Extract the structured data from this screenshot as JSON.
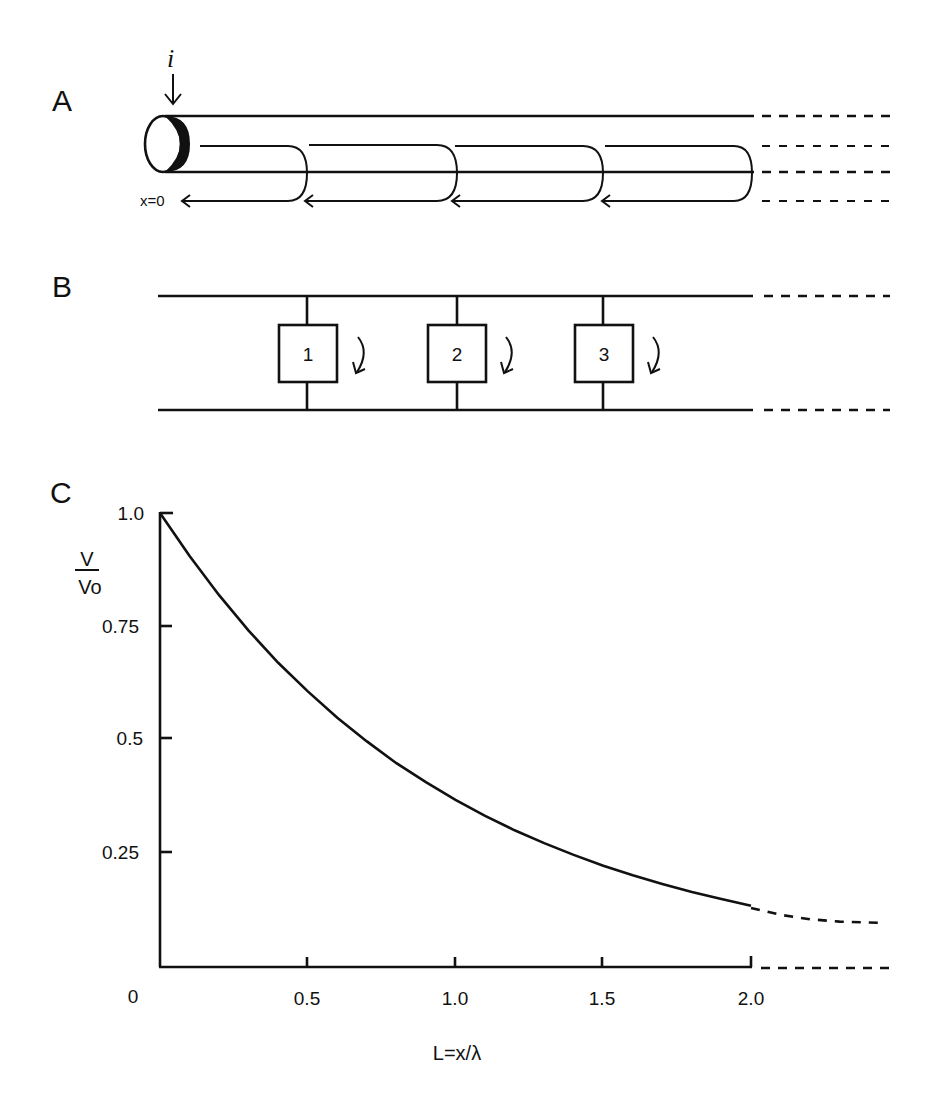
{
  "panels": {
    "a": {
      "label": "A",
      "current_symbol": "i",
      "origin_label": "x=0",
      "description": "Cylindrical cable with current injected at x=0 flowing along the core and returning via membrane leak paths"
    },
    "b": {
      "label": "B",
      "compartments": [
        {
          "label": "1"
        },
        {
          "label": "2"
        },
        {
          "label": "3"
        }
      ]
    },
    "c": {
      "label": "C",
      "ylabel_numerator": "V",
      "ylabel_denominator": "Vo",
      "xlabel": "L=x/λ",
      "x_ticks": [
        "0",
        "0.5",
        "1.0",
        "1.5",
        "2.0"
      ],
      "y_ticks": [
        "1.0",
        "0.75",
        "0.5",
        "0.25"
      ]
    }
  },
  "chart_data": {
    "type": "line",
    "title": "",
    "xlabel": "L=x/λ",
    "ylabel": "V/Vo",
    "xlim": [
      0,
      2.45
    ],
    "ylim": [
      0,
      1.0
    ],
    "grid": false,
    "legend": null,
    "x_ticks": [
      0,
      0.5,
      1.0,
      1.5,
      2.0
    ],
    "y_ticks": [
      0.25,
      0.5,
      0.75,
      1.0
    ],
    "series": [
      {
        "name": "V/Vo = exp(-L) (solid)",
        "style": "solid",
        "x": [
          0,
          0.1,
          0.2,
          0.3,
          0.4,
          0.5,
          0.6,
          0.7,
          0.8,
          0.9,
          1.0,
          1.1,
          1.2,
          1.3,
          1.4,
          1.5,
          1.6,
          1.7,
          1.8,
          1.9,
          2.0
        ],
        "values": [
          1.0,
          0.905,
          0.819,
          0.741,
          0.67,
          0.607,
          0.549,
          0.497,
          0.449,
          0.407,
          0.368,
          0.333,
          0.301,
          0.273,
          0.247,
          0.223,
          0.202,
          0.183,
          0.165,
          0.15,
          0.135
        ]
      },
      {
        "name": "extrapolated continuation (dashed)",
        "style": "dashed",
        "x": [
          2.0,
          2.1,
          2.2,
          2.3,
          2.45
        ],
        "values": [
          0.13,
          0.115,
          0.105,
          0.1,
          0.097
        ]
      }
    ],
    "annotations": [
      "dashed continuation of x-axis beyond 2.0"
    ]
  }
}
